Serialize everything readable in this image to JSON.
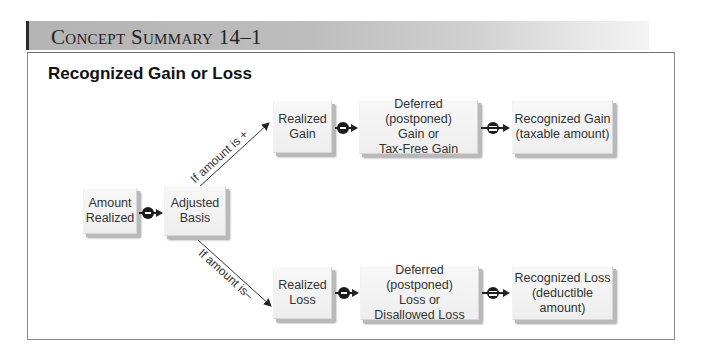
{
  "header": {
    "title": "Concept Summary 14–1"
  },
  "section": {
    "title": "Recognized Gain or Loss"
  },
  "nodes": {
    "amount_realized": "Amount\nRealized",
    "adjusted_basis": "Adjusted\nBasis",
    "realized_gain": "Realized\nGain",
    "deferred_gain": "Deferred (postponed)\nGain or\nTax-Free Gain",
    "recognized_gain": "Recognized Gain\n(taxable amount)",
    "realized_loss": "Realized\nLoss",
    "deferred_loss": "Deferred (postponed)\nLoss or\nDisallowed Loss",
    "recognized_loss": "Recognized Loss\n(deductible\namount)"
  },
  "branches": {
    "positive": "If amount is +",
    "negative": "If amount is–"
  },
  "operators": {
    "minus": "minus",
    "equals": "equals"
  }
}
